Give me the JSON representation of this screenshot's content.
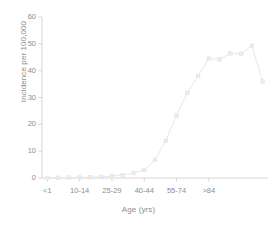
{
  "chart_data": {
    "type": "scatter",
    "title": "",
    "subtitle": "",
    "xlabel": "Age (yrs)",
    "ylabel": "Incidence per 100,000",
    "grid": false,
    "legend": false,
    "legend_position": "none",
    "marker": "square",
    "connected": true,
    "series_color": "#e8e8e8",
    "axis_color": "#d6d6d6",
    "tick_text_color": "#8d8d8d",
    "ylim": [
      0,
      60
    ],
    "yticks": [
      0,
      10,
      20,
      30,
      40,
      50,
      60
    ],
    "ytick_labels": [
      "0",
      "10",
      "20",
      "30",
      "40",
      "50",
      "60"
    ],
    "xtick_labels": [
      "<1",
      "10-14",
      "25-29",
      "40-44",
      "55-74",
      ">84"
    ],
    "xtick_indices": [
      0,
      3,
      6,
      9,
      12,
      15
    ],
    "categories": [
      "<1",
      "1-4",
      "5-9",
      "10-14",
      "15-19",
      "20-24",
      "25-29",
      "30-34",
      "35-39",
      "40-44",
      "45-49",
      "50-54",
      "55-74",
      "65-74",
      "75-79",
      "80-84",
      ">84"
    ],
    "x": [
      0,
      1,
      2,
      3,
      4,
      5,
      6,
      7,
      8,
      9,
      10,
      11,
      12,
      13,
      14,
      15,
      16
    ],
    "values": [
      0.1,
      0.1,
      0.2,
      0.2,
      0.3,
      0.4,
      0.7,
      1.1,
      1.9,
      3.0,
      6.8,
      13.9,
      23.3,
      31.8,
      38.0,
      44.5,
      44.2
    ],
    "values_extended": [
      0.1,
      0.1,
      0.2,
      0.2,
      0.3,
      0.4,
      0.7,
      1.1,
      1.9,
      3.0,
      6.8,
      13.9,
      23.3,
      31.8,
      38.0,
      44.5,
      44.2,
      46.4,
      46.3,
      49.3,
      36.0
    ],
    "n_points": 21,
    "peak_value": 49.3,
    "peak_index": 19,
    "final_value": 36.0
  }
}
